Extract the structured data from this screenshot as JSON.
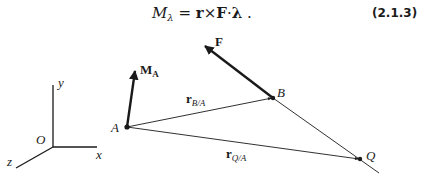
{
  "equation": {
    "lhs_symbol": "M",
    "lhs_subscript": "λ",
    "equals": "=",
    "r": "r",
    "cross": "×",
    "F": "F",
    "dot": "·",
    "lambda": "λ",
    "period": ".",
    "number": "(2.1.3)"
  },
  "diagram": {
    "axes": {
      "origin_label": "O",
      "x_label": "x",
      "y_label": "y",
      "z_label": "z"
    },
    "points": {
      "A": "A",
      "B": "B",
      "Q": "Q"
    },
    "vectors": {
      "moment": {
        "symbol": "M",
        "subscript": "A"
      },
      "force": {
        "symbol": "F"
      },
      "r_BA": {
        "symbol": "r",
        "subscript": "B/A"
      },
      "r_QA": {
        "symbol": "r",
        "subscript": "Q/A"
      }
    },
    "colors": {
      "ink": "#1a1a1a"
    }
  }
}
